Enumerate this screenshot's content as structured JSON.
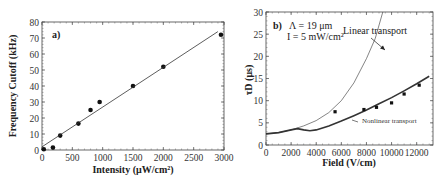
{
  "chart_data": [
    {
      "type": "scatter",
      "panel_label": "a)",
      "title": "",
      "xlabel": "Intensity (μW/cm²)",
      "ylabel": "Frequency Cutoff (kHz)",
      "xlim": [
        0,
        3000
      ],
      "ylim": [
        0,
        80
      ],
      "xticks": [
        "0",
        "500",
        "1000",
        "1500",
        "2000",
        "2500",
        "3000"
      ],
      "yticks": [
        "0",
        "10",
        "20",
        "30",
        "40",
        "50",
        "60",
        "70",
        "80"
      ],
      "series": [
        {
          "name": "data",
          "kind": "points",
          "x": [
            30,
            180,
            300,
            600,
            800,
            950,
            1500,
            2000,
            2950
          ],
          "y": [
            0.5,
            1.5,
            9,
            16.5,
            25,
            30,
            40,
            52,
            72
          ]
        },
        {
          "name": "linear fit",
          "kind": "line",
          "x": [
            0,
            2900
          ],
          "y": [
            2,
            74
          ]
        }
      ]
    },
    {
      "type": "line",
      "panel_label": "b)",
      "annotation_lines": [
        "Λ = 19 μm",
        "I = 5 mW/cm²"
      ],
      "xlabel": "Field (V/cm)",
      "ylabel": "τD (μs)",
      "xlim": [
        0,
        13300
      ],
      "ylim": [
        0,
        30
      ],
      "xticks": [
        "0",
        "2000",
        "4000",
        "6000",
        "8000",
        "10000",
        "12000"
      ],
      "yticks": [
        "0",
        "5",
        "10",
        "15",
        "20",
        "25",
        "30"
      ],
      "series": [
        {
          "name": "Linear transport",
          "kind": "line",
          "x": [
            0,
            1000,
            2000,
            3000,
            4000,
            5000,
            6000,
            7000,
            8000,
            8700,
            9300
          ],
          "y": [
            2.5,
            2.8,
            3.4,
            4.3,
            5.5,
            7.3,
            10,
            14,
            19.5,
            24,
            30
          ]
        },
        {
          "name": "Nonlinear transport",
          "kind": "line",
          "x": [
            0,
            1000,
            2000,
            2500,
            3000,
            3500,
            4000,
            5000,
            6000,
            7000,
            8000,
            9000,
            10000,
            11000,
            12000,
            13000
          ],
          "y": [
            2.5,
            2.8,
            3.4,
            3.7,
            3.4,
            3.2,
            3.4,
            4.3,
            5.4,
            6.6,
            7.9,
            9.3,
            10.7,
            12.2,
            13.8,
            15.5
          ]
        },
        {
          "name": "data",
          "kind": "points",
          "x": [
            5500,
            7800,
            8800,
            10000,
            11000,
            12200
          ],
          "y": [
            7.5,
            8,
            8.5,
            9.5,
            11.5,
            13.5
          ]
        }
      ],
      "labels": {
        "linear": "Linear transport",
        "nonlinear": "Nonlinear transport"
      }
    }
  ]
}
